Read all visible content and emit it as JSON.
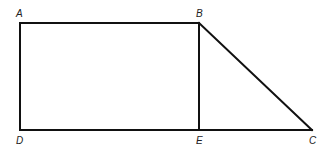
{
  "diagram": {
    "type": "geometry-figure",
    "stroke_color": "#111111",
    "background": "#ffffff",
    "points": [
      {
        "name": "A",
        "label": "A"
      },
      {
        "name": "B",
        "label": "B"
      },
      {
        "name": "C",
        "label": "C"
      },
      {
        "name": "D",
        "label": "D"
      },
      {
        "name": "E",
        "label": "E"
      }
    ],
    "segments": [
      "AB",
      "BE",
      "ED",
      "DA",
      "BC",
      "EC"
    ],
    "shapes": [
      "rectangle ABED",
      "right triangle BEC"
    ]
  }
}
